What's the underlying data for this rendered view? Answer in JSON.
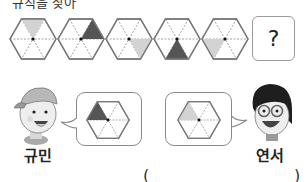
{
  "question": {
    "instruction_partial": "규칙을 찾아",
    "sequence": [
      {
        "shaded_sector": "top",
        "shade": "light"
      },
      {
        "shaded_sector": "top-right",
        "shade": "dark"
      },
      {
        "shaded_sector": "bottom-right",
        "shade": "light"
      },
      {
        "shaded_sector": "bottom",
        "shade": "dark"
      },
      {
        "shaded_sector": "bottom-left",
        "shade": "light"
      }
    ],
    "unknown_label": "?"
  },
  "speakers": [
    {
      "name": "규민",
      "answer_hexagon": {
        "shaded_sector": "top-left",
        "shade": "dark"
      }
    },
    {
      "name": "연서",
      "answer_hexagon": {
        "shaded_sector": "top-left",
        "shade": "light"
      }
    }
  ],
  "answer_blank": {
    "open": "(",
    "close": ")"
  },
  "colors": {
    "light": "#d3d3d3",
    "dark": "#555555",
    "outline": "#7a7a7a"
  }
}
